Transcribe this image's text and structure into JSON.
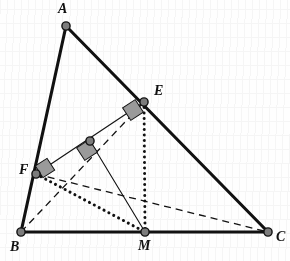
{
  "figure": {
    "domain": "geometry-diagram",
    "width": 290,
    "height": 261,
    "background_color": "#fefefe",
    "stroke_color": "#111111",
    "right_angle_fill": "#9a9a9a",
    "vertex_fill": "#7c7c7c"
  },
  "points": [
    {
      "id": "A",
      "label": "A",
      "x": 66,
      "y": 26,
      "label_x": 58,
      "label_y": 2,
      "dot": true
    },
    {
      "id": "B",
      "label": "B",
      "x": 21,
      "y": 232,
      "label_x": 10,
      "label_y": 240,
      "dot": true
    },
    {
      "id": "C",
      "label": "C",
      "x": 268,
      "y": 232,
      "label_x": 276,
      "label_y": 230,
      "dot": true
    },
    {
      "id": "E",
      "label": "E",
      "x": 144,
      "y": 102,
      "label_x": 154,
      "label_y": 84,
      "dot": true
    },
    {
      "id": "F",
      "label": "F",
      "x": 36,
      "y": 174,
      "label_x": 19,
      "label_y": 163,
      "dot": true
    },
    {
      "id": "M",
      "label": "M",
      "x": 145,
      "y": 232,
      "label_x": 138,
      "label_y": 239,
      "dot": true
    },
    {
      "id": "N",
      "label": "",
      "x": 90,
      "y": 141,
      "label_x": 90,
      "label_y": 141,
      "dot": true
    }
  ],
  "segments": [
    {
      "id": "AB",
      "from": "A",
      "to": "B",
      "style": "solid",
      "width": 3.1,
      "name": "side-ab"
    },
    {
      "id": "AC",
      "from": "A",
      "to": "C",
      "style": "solid",
      "width": 3.1,
      "name": "side-ac"
    },
    {
      "id": "BC",
      "from": "B",
      "to": "C",
      "style": "solid",
      "width": 3.1,
      "name": "side-bc"
    },
    {
      "id": "FE",
      "from": "F",
      "to": "E",
      "style": "solid",
      "width": 1.1,
      "name": "segment-fe"
    },
    {
      "id": "NM",
      "from": "N",
      "to": "M",
      "style": "solid",
      "width": 1.1,
      "name": "segment-nm"
    },
    {
      "id": "EM",
      "from": "E",
      "to": "M",
      "style": "dotted",
      "width": 3.0,
      "name": "segment-em"
    },
    {
      "id": "FM",
      "from": "F",
      "to": "M",
      "style": "dotted",
      "width": 3.0,
      "name": "segment-fm"
    },
    {
      "id": "BE",
      "from": "B",
      "to": "E",
      "style": "dashed",
      "width": 1.3,
      "name": "segment-be"
    },
    {
      "id": "FC",
      "from": "F",
      "to": "C",
      "style": "dashed",
      "width": 1.3,
      "name": "segment-fc"
    }
  ],
  "right_angles": [
    {
      "id": "ra-e",
      "at": "E",
      "cx": 133,
      "cy": 110,
      "size": 15,
      "rotation": -33,
      "name": "right-angle-mark-e"
    },
    {
      "id": "ra-n",
      "at": "N",
      "cx": 87,
      "cy": 150,
      "size": 15,
      "rotation": -33,
      "name": "right-angle-mark-n"
    },
    {
      "id": "ra-f",
      "at": "F",
      "cx": 45,
      "cy": 168,
      "size": 14,
      "rotation": -33,
      "name": "right-angle-mark-f"
    }
  ],
  "labels": {
    "A": "A",
    "B": "B",
    "C": "C",
    "E": "E",
    "F": "F",
    "M": "M"
  },
  "chart_data": {
    "type": "diagram",
    "vertices": {
      "A": [
        66,
        26
      ],
      "B": [
        21,
        232
      ],
      "C": [
        268,
        232
      ]
    },
    "interior_points": {
      "E": [
        144,
        102
      ],
      "F": [
        36,
        174
      ],
      "M": [
        145,
        232
      ],
      "N": [
        90,
        141
      ]
    },
    "edges": [
      "AB",
      "AC",
      "BC",
      "FE",
      "NM",
      "EM",
      "FM",
      "BE",
      "FC"
    ],
    "perpendicular_marks_at": [
      "E",
      "N",
      "F"
    ]
  }
}
